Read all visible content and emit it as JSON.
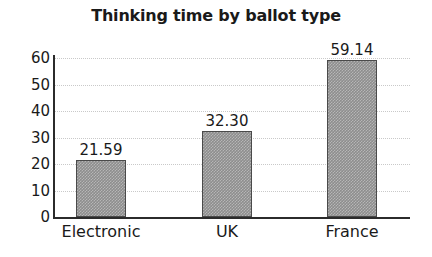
{
  "chart_data": {
    "type": "bar",
    "title": "Thinking time by ballot type",
    "xlabel": "",
    "ylabel": "",
    "categories": [
      "Electronic",
      "UK",
      "France"
    ],
    "values": [
      21.59,
      32.3,
      59.14
    ],
    "value_labels": [
      "21.59",
      "32.30",
      "59.14"
    ],
    "ylim": [
      0,
      60
    ],
    "ytick_labels": [
      "0",
      "10",
      "20",
      "30",
      "40",
      "50",
      "60"
    ],
    "ytick_values": [
      0,
      10,
      20,
      30,
      40,
      50,
      60
    ],
    "grid": true,
    "grid_axis": "y",
    "legend": false,
    "bar_color": "#8d8d8d",
    "bar_border_color": "#4a4a4a",
    "axis_color": "#2b2b2b",
    "grid_color": "#c9c9c9",
    "text_color": "#1a1a1a"
  }
}
